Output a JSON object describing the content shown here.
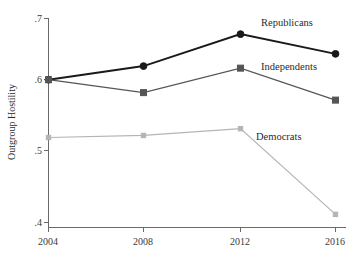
{
  "chart_data": {
    "type": "line",
    "title": "",
    "subtitle": "",
    "xlabel": "",
    "ylabel": "Outgroup Hostility",
    "categories": [
      "2004",
      "2008",
      "2012",
      "2016"
    ],
    "x": [
      2004,
      2008,
      2012,
      2016
    ],
    "xlim": [
      2004,
      2016
    ],
    "ylim": [
      0.4,
      0.7
    ],
    "yticks": [
      ".4",
      ".5",
      ".6",
      ".7"
    ],
    "ytick_values": [
      0.4,
      0.5,
      0.6,
      0.7
    ],
    "xticks": [
      "2004",
      "2008",
      "2012",
      "2016"
    ],
    "grid": false,
    "legend": "inline-annotations",
    "legend_position": "right-of-series-endpoints",
    "series": [
      {
        "name": "Republicans",
        "values": [
          0.61,
          0.63,
          0.677,
          0.648
        ],
        "color": "#1a1a1a",
        "marker": "circle",
        "line_width": 2.0,
        "label": "Republicans"
      },
      {
        "name": "Independents",
        "values": [
          0.61,
          0.591,
          0.627,
          0.58
        ],
        "color": "#555555",
        "marker": "square",
        "line_width": 1.2,
        "label": "Independents"
      },
      {
        "name": "Democrats",
        "values": [
          0.525,
          0.528,
          0.538,
          0.412
        ],
        "color": "#b4b4b4",
        "marker": "square",
        "line_width": 1.2,
        "label": "Democrats"
      }
    ],
    "annotations": [
      {
        "text": "Republicans",
        "x": 2016,
        "y": 0.683
      },
      {
        "text": "Independents",
        "x": 2016,
        "y": 0.628
      },
      {
        "text": "Democrats",
        "x": 2014,
        "y": 0.54
      }
    ],
    "axis_color": "#6a6a6a",
    "background": "#ffffff"
  },
  "labels": {
    "y_axis_title": "Outgroup Hostility",
    "ytick_0": ".4",
    "ytick_1": ".5",
    "ytick_2": ".6",
    "ytick_3": ".7",
    "xtick_0": "2004",
    "xtick_1": "2008",
    "xtick_2": "2012",
    "xtick_3": "2016",
    "series_0": "Republicans",
    "series_1": "Independents",
    "series_2": "Democrats"
  }
}
